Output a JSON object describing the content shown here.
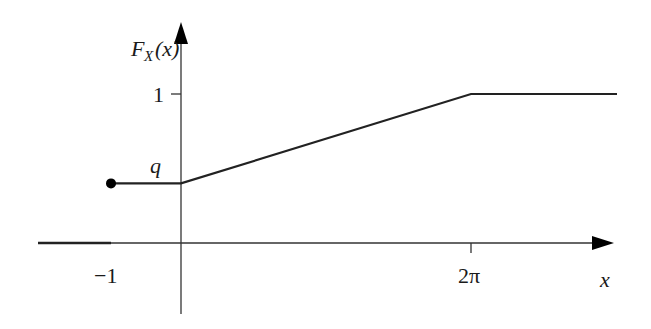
{
  "chart_data": {
    "type": "line",
    "title": "",
    "xlabel": "x",
    "ylabel": "F_X(x)",
    "ylabel_parts": {
      "main": "F",
      "sub": "X",
      "arg": "(x)"
    },
    "x_ticks": [
      {
        "value": -1,
        "label": "−1"
      },
      {
        "value": 6.283185,
        "label": "2π"
      }
    ],
    "y_ticks": [
      {
        "value": 1,
        "label": "1"
      }
    ],
    "annotations": [
      {
        "text": "q",
        "x": -0.4,
        "y": 0.4
      }
    ],
    "series": [
      {
        "name": "F_X(x) for x < -1",
        "points": [
          [
            -2,
            0
          ],
          [
            -1,
            0
          ]
        ],
        "style": "thick"
      },
      {
        "name": "F_X(x) for -1 <= x",
        "points": [
          [
            -1,
            0.4
          ],
          [
            0,
            0.4
          ],
          [
            6.283185,
            1
          ],
          [
            10,
            1
          ]
        ],
        "style": "line",
        "closed_start_dot": true
      }
    ],
    "q_value": 0.4,
    "xlim": [
      -2.6,
      10.3
    ],
    "ylim": [
      -0.48,
      1.45
    ],
    "grid": false,
    "legend": "none"
  }
}
